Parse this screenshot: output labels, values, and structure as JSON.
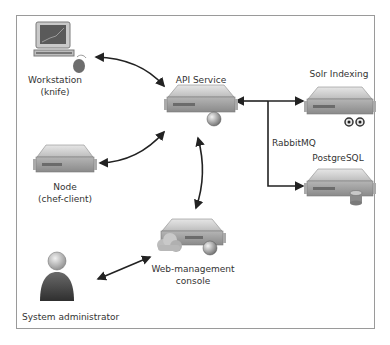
{
  "diagram": {
    "type": "architecture",
    "nodes": {
      "workstation": {
        "label1": "Workstation",
        "label2": "(knife)",
        "icon": "desktop-computer-icon"
      },
      "api": {
        "label1": "API Service",
        "icon": "server-icon"
      },
      "solr": {
        "label1": "Solr Indexing",
        "icon": "server-icon"
      },
      "postgres": {
        "label1": "PostgreSQL",
        "icon": "server-icon"
      },
      "node": {
        "label1": "Node",
        "label2": "(chef-client)",
        "icon": "server-icon"
      },
      "webui": {
        "label1": "Web-management",
        "label2": "console",
        "icon": "server-icon"
      },
      "admin": {
        "label1": "System administrator",
        "icon": "person-icon"
      }
    },
    "edge_labels": {
      "rabbitmq": "RabbitMQ"
    },
    "edges": [
      {
        "from": "Workstation (knife)",
        "to": "API Service",
        "direction": "both"
      },
      {
        "from": "Node (chef-client)",
        "to": "API Service",
        "direction": "both"
      },
      {
        "from": "Web-management console",
        "to": "API Service",
        "direction": "both"
      },
      {
        "from": "System administrator",
        "to": "Web-management console",
        "direction": "both"
      },
      {
        "from": "RabbitMQ",
        "to": "API Service",
        "direction": "one"
      },
      {
        "from": "RabbitMQ",
        "to": "Solr Indexing",
        "direction": "one"
      },
      {
        "from": "RabbitMQ",
        "to": "PostgreSQL",
        "direction": "one"
      }
    ],
    "colors": {
      "line": "#222222",
      "frame": "#9a9a9a",
      "server_top": "#d8d8d8",
      "server_front": "#9e9e9e",
      "text": "#333333"
    }
  }
}
